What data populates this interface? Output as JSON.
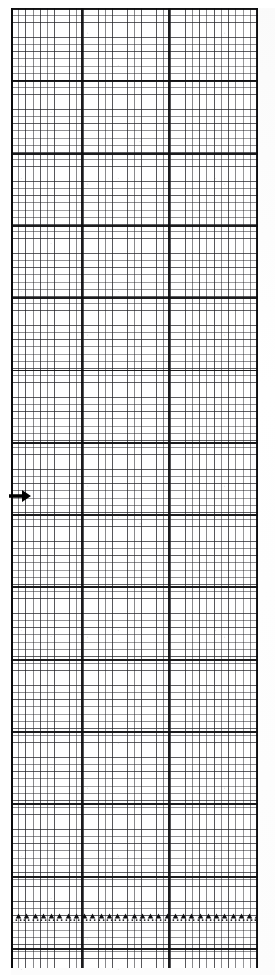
{
  "document": {
    "kind": "chart-recorder-strip",
    "title": "Graph paper recording strip",
    "background_color": "#ffffff",
    "ink_color": "#0a0a0c"
  },
  "grid": {
    "minor_cell_px": 7.2,
    "medium_every": 2,
    "major_row_height_px": 72.3,
    "minor_line_color": "#282a2d",
    "major_line_color": "#0a0a0c",
    "origin_x": 11,
    "origin_y": 8,
    "width": 247,
    "height": 960,
    "major_vertical_positions": [
      0,
      71,
      158,
      247
    ],
    "major_vertical_labels": [
      "left-edge",
      "rule-1",
      "rule-2",
      "right-edge"
    ]
  },
  "annotations": {
    "arrow": {
      "icon": "arrow-right-icon",
      "label": "",
      "x": 9,
      "y": 487,
      "direction": "right",
      "color": "#000000"
    },
    "event_markers": {
      "icon": "triangle-marker-icon",
      "label": "",
      "count": 30,
      "row_y": 908,
      "start_x": 4,
      "spacing_px": 8.25,
      "color": "#111114"
    }
  },
  "chart_data": {
    "type": "line",
    "title": "",
    "xlabel": "",
    "ylabel": "",
    "x": [],
    "series": [
      {
        "name": "trace",
        "values": []
      }
    ],
    "grid": true,
    "legend": "none",
    "annotations": [
      {
        "type": "arrow",
        "at_y_px": 496,
        "at_x_px": 20,
        "points": "right"
      },
      {
        "type": "marker-row",
        "at_y_px": 915,
        "count": 30,
        "shape": "triangle"
      }
    ]
  }
}
